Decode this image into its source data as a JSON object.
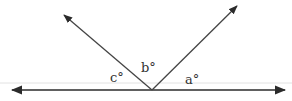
{
  "diagram": {
    "type": "angles-on-a-straight-line",
    "labels": {
      "a": "a°",
      "b": "b°",
      "c": "c°"
    },
    "colors": {
      "line": "#2b2b2b",
      "faint_line": "#d8d8d8",
      "text": "#333333",
      "background": "#ffffff"
    },
    "geometry": {
      "baseline": {
        "x1": 12,
        "y1": 90,
        "x2": 285,
        "y2": 90,
        "arrows": "both"
      },
      "vertex": {
        "x": 152,
        "y": 90
      },
      "left_ray": {
        "x": 63,
        "y": 14
      },
      "right_ray": {
        "x": 238,
        "y": 5
      }
    }
  }
}
